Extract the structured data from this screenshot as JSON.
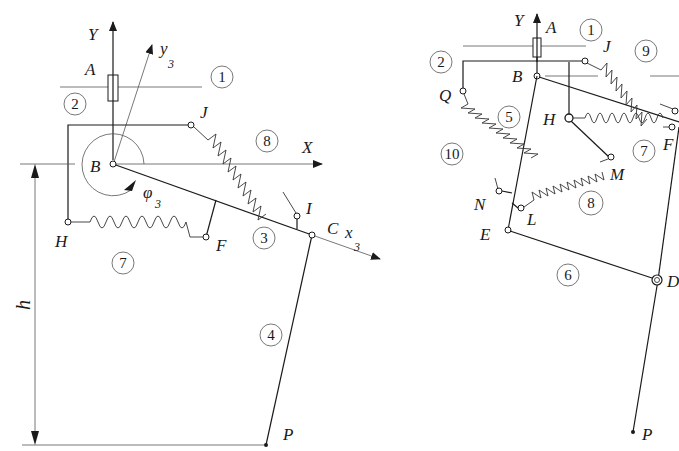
{
  "left_diagram": {
    "axes": {
      "Y": "Y",
      "X": "X",
      "y3": "y",
      "y3_sub": "3",
      "x3": "x",
      "x3_sub": "3"
    },
    "points": {
      "A": "A",
      "B": "B",
      "C": "C",
      "F": "F",
      "H": "H",
      "I": "I",
      "J": "J",
      "P": "P"
    },
    "angle": {
      "symbol": "φ",
      "sub": "3"
    },
    "dimension": "h",
    "parts": [
      "1",
      "2",
      "3",
      "4",
      "7",
      "8"
    ]
  },
  "right_diagram": {
    "axes": {
      "Y": "Y"
    },
    "points": {
      "A": "A",
      "B": "B",
      "D": "D",
      "E": "E",
      "F": "F",
      "H": "H",
      "J": "J",
      "L": "L",
      "M": "M",
      "N": "N",
      "P": "P",
      "Q": "Q"
    },
    "parts": [
      "1",
      "2",
      "5",
      "6",
      "7",
      "8",
      "9",
      "10"
    ]
  }
}
